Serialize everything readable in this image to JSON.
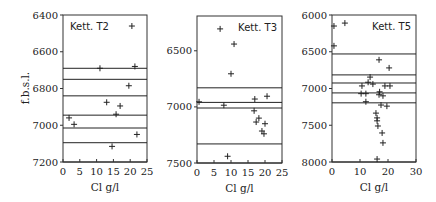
{
  "chart_data": [
    {
      "type": "scatter",
      "title": "Kett. T2",
      "xlabel": "Cl g/l",
      "ylabel": "f.b.s.l.",
      "xlim": [
        0,
        25
      ],
      "ylim": [
        6400,
        7200
      ],
      "y_inverted": true,
      "xticks": [
        0,
        5,
        10,
        15,
        20,
        25
      ],
      "yticks": [
        6400,
        6600,
        6800,
        7000,
        7200
      ],
      "title_position": "top-left",
      "grid": false,
      "horizontal_lines": [
        6690,
        6750,
        6840,
        6945,
        7015,
        7095
      ],
      "points": [
        {
          "x": 20.5,
          "y": 6460
        },
        {
          "x": 11.0,
          "y": 6690
        },
        {
          "x": 21.4,
          "y": 6680
        },
        {
          "x": 19.6,
          "y": 6785
        },
        {
          "x": 13.0,
          "y": 6875
        },
        {
          "x": 17.0,
          "y": 6895
        },
        {
          "x": 15.8,
          "y": 6940
        },
        {
          "x": 1.8,
          "y": 6960
        },
        {
          "x": 3.3,
          "y": 6995
        },
        {
          "x": 22.0,
          "y": 7050
        },
        {
          "x": 14.6,
          "y": 7115
        }
      ]
    },
    {
      "type": "scatter",
      "title": "Kett. T3",
      "xlabel": "Cl g/l",
      "ylabel": "",
      "xlim": [
        0,
        25
      ],
      "ylim": [
        6190,
        7500
      ],
      "y_inverted": true,
      "xticks": [
        0,
        5,
        10,
        15,
        20,
        25
      ],
      "yticks": [
        6500,
        7000,
        7500
      ],
      "title_position": "top-right",
      "grid": false,
      "horizontal_lines": [
        6830,
        6960,
        7010,
        7330
      ],
      "points": [
        {
          "x": 6.8,
          "y": 6305
        },
        {
          "x": 10.9,
          "y": 6440
        },
        {
          "x": 10.0,
          "y": 6705
        },
        {
          "x": 0.6,
          "y": 6955
        },
        {
          "x": 7.9,
          "y": 6985
        },
        {
          "x": 17.0,
          "y": 6930
        },
        {
          "x": 20.6,
          "y": 6905
        },
        {
          "x": 16.8,
          "y": 7035
        },
        {
          "x": 18.2,
          "y": 7100
        },
        {
          "x": 17.4,
          "y": 7135
        },
        {
          "x": 20.0,
          "y": 7150
        },
        {
          "x": 19.1,
          "y": 7215
        },
        {
          "x": 19.7,
          "y": 7240
        },
        {
          "x": 9.0,
          "y": 7440
        }
      ]
    },
    {
      "type": "scatter",
      "title": "Kett. T5",
      "xlabel": "Cl g/l",
      "ylabel": "",
      "xlim": [
        0,
        30
      ],
      "ylim": [
        6000,
        8000
      ],
      "y_inverted": true,
      "xticks": [
        0,
        10,
        20,
        30
      ],
      "yticks": [
        6000,
        6500,
        7000,
        7500,
        8000
      ],
      "title_position": "top-right",
      "grid": false,
      "horizontal_lines": [
        6530,
        6815,
        6925,
        7060,
        7195
      ],
      "points": [
        {
          "x": 0.7,
          "y": 6150
        },
        {
          "x": 4.6,
          "y": 6110
        },
        {
          "x": 0.7,
          "y": 6420
        },
        {
          "x": 16.8,
          "y": 6610
        },
        {
          "x": 20.4,
          "y": 6720
        },
        {
          "x": 13.6,
          "y": 6845
        },
        {
          "x": 12.9,
          "y": 6915
        },
        {
          "x": 14.6,
          "y": 6940
        },
        {
          "x": 10.7,
          "y": 6965
        },
        {
          "x": 18.9,
          "y": 6965
        },
        {
          "x": 20.7,
          "y": 6965
        },
        {
          "x": 17.0,
          "y": 7045
        },
        {
          "x": 10.4,
          "y": 7070
        },
        {
          "x": 12.1,
          "y": 7070
        },
        {
          "x": 16.8,
          "y": 7085
        },
        {
          "x": 18.2,
          "y": 7100
        },
        {
          "x": 12.1,
          "y": 7180
        },
        {
          "x": 17.5,
          "y": 7225
        },
        {
          "x": 19.6,
          "y": 7240
        },
        {
          "x": 15.7,
          "y": 7335
        },
        {
          "x": 16.1,
          "y": 7400
        },
        {
          "x": 16.1,
          "y": 7440
        },
        {
          "x": 16.4,
          "y": 7510
        },
        {
          "x": 17.9,
          "y": 7605
        },
        {
          "x": 18.2,
          "y": 7740
        },
        {
          "x": 16.1,
          "y": 7960
        }
      ]
    }
  ]
}
